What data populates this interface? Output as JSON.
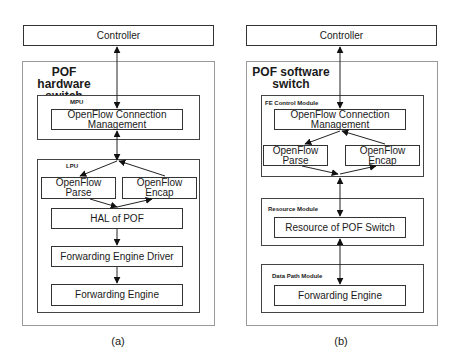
{
  "panel_a": {
    "controller": "Controller",
    "switch_title_line1": "POF hardware",
    "switch_title_line2": "switch",
    "mpu_label": "MPU",
    "ocm_line1": "OpenFlow Connection",
    "ocm_line2": "Management",
    "lpu_label": "LPU",
    "parse_line1": "OpenFlow",
    "parse_line2": "Parse",
    "encap_line1": "OpenFlow",
    "encap_line2": "Encap",
    "hal": "HAL of POF",
    "fed": "Forwarding Engine Driver",
    "fe": "Forwarding Engine",
    "caption": "(a)"
  },
  "panel_b": {
    "controller": "Controller",
    "switch_title_line1": "POF software",
    "switch_title_line2": "switch",
    "fe_control_label": "FE Control Module",
    "ocm_line1": "OpenFlow Connection",
    "ocm_line2": "Management",
    "parse_line1": "OpenFlow",
    "parse_line2": "Parse",
    "encap_line1": "OpenFlow",
    "encap_line2": "Encap",
    "resource_label": "Resource Module",
    "resource": "Resource of POF Switch",
    "datapath_label": "Data Path Module",
    "fe": "Forwarding Engine",
    "caption": "(b)"
  }
}
